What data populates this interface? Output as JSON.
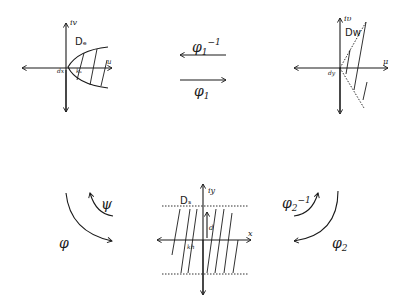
{
  "diagram": {
    "panels": {
      "top_left": {
        "region_label": "Dₑ",
        "vertical_axis_label": "iv",
        "horizontal_axis_label": "u",
        "origin_label": "dx",
        "inner_label": "kₛ"
      },
      "top_right": {
        "region_label": "Dw",
        "vertical_axis_label": "iυ",
        "horizontal_axis_label": "μ",
        "origin_label": "dy"
      },
      "bottom_center": {
        "region_label": "Dₛ",
        "vertical_axis_label": "iy",
        "horizontal_axis_label": "x",
        "height_label": "d",
        "inner_label": "kh"
      }
    },
    "maps": {
      "phi1_inverse": {
        "base": "φ",
        "sub": "1",
        "sup": "−1"
      },
      "phi1": {
        "base": "φ",
        "sub": "1"
      },
      "phi2_inverse": {
        "base": "φ",
        "sub": "2",
        "sup": "−1"
      },
      "phi2": {
        "base": "φ",
        "sub": "2"
      },
      "psi": {
        "base": "ψ"
      },
      "phi": {
        "base": "φ"
      }
    }
  }
}
